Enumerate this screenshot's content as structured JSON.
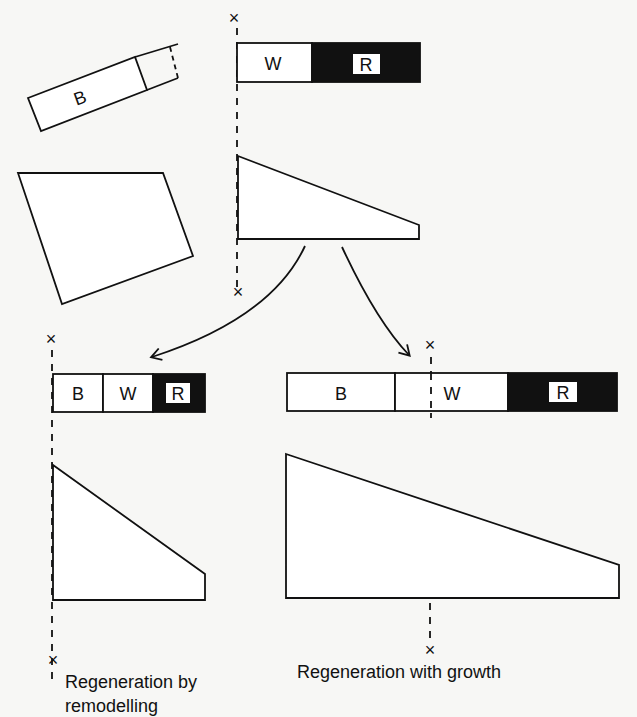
{
  "diagram": {
    "type": "regeneration-diagram",
    "original": {
      "fragment_label": "B",
      "segments": [
        {
          "label": "W",
          "fill": "#ffffff"
        },
        {
          "label": "R",
          "fill": "#111111"
        }
      ]
    },
    "remodelling": {
      "segments": [
        {
          "label": "B",
          "fill": "#ffffff"
        },
        {
          "label": "W",
          "fill": "#ffffff"
        },
        {
          "label": "R",
          "fill": "#111111"
        }
      ],
      "caption_line1": "Regeneration by",
      "caption_line2": "remodelling"
    },
    "growth": {
      "segments": [
        {
          "label": "B",
          "fill": "#ffffff"
        },
        {
          "label": "W",
          "fill": "#ffffff"
        },
        {
          "label": "R",
          "fill": "#111111"
        }
      ],
      "caption": "Regeneration with growth"
    },
    "marker_symbol": "×"
  }
}
